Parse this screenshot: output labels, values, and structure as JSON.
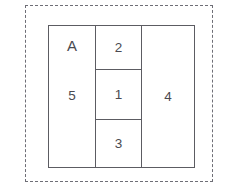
{
  "figure": {
    "type": "rectangle-partition-diagram",
    "outer_boundary": {
      "style": "dashed",
      "color": "#6e6e76"
    },
    "partition": {
      "border_color": "#5c5c62",
      "fill_color": "#ffffff"
    },
    "text_color": "#4a4a50",
    "background_color": "#ffffff"
  },
  "regions": {
    "group_label": "A",
    "left": {
      "label": "5"
    },
    "middle": {
      "top": "2",
      "center": "1",
      "bottom": "3"
    },
    "right": {
      "label": "4"
    }
  }
}
